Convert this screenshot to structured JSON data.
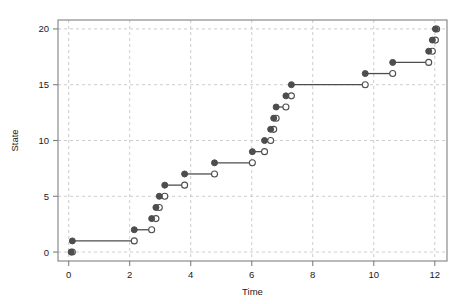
{
  "chart_data": {
    "type": "line",
    "variant": "step-post-with-open-closed-endpoints",
    "title": "",
    "xlabel": "Time",
    "ylabel": "State",
    "xlim": [
      -0.35,
      12.4
    ],
    "ylim": [
      -0.8,
      20.8
    ],
    "xticks": [
      0,
      2,
      4,
      6,
      8,
      10,
      12
    ],
    "xticklabels": [
      "0",
      "2",
      "4",
      "6",
      "8",
      "10",
      "12"
    ],
    "yticks": [
      0,
      5,
      10,
      15,
      20
    ],
    "yticklabels": [
      "0",
      "5",
      "10",
      "15",
      "20"
    ],
    "grid": true,
    "grid_style": "dashed",
    "grid_color": "#bfbfbf",
    "legend": "none",
    "line_color": "#4d4d4d",
    "marker_filled_color": "#4d4d4d",
    "marker_open_fill": "#ffffff",
    "marker_open_edge": "#4d4d4d",
    "axis_color": "#808080",
    "segments": [
      {
        "state": 0,
        "x_start": 0.08,
        "x_end": 0.12
      },
      {
        "state": 1,
        "x_start": 0.12,
        "x_end": 2.15
      },
      {
        "state": 2,
        "x_start": 2.15,
        "x_end": 2.72
      },
      {
        "state": 3,
        "x_start": 2.72,
        "x_end": 2.86
      },
      {
        "state": 4,
        "x_start": 2.86,
        "x_end": 2.97
      },
      {
        "state": 5,
        "x_start": 2.97,
        "x_end": 3.15
      },
      {
        "state": 6,
        "x_start": 3.15,
        "x_end": 3.8
      },
      {
        "state": 7,
        "x_start": 3.8,
        "x_end": 4.78
      },
      {
        "state": 8,
        "x_start": 4.78,
        "x_end": 6.02
      },
      {
        "state": 9,
        "x_start": 6.02,
        "x_end": 6.42
      },
      {
        "state": 10,
        "x_start": 6.42,
        "x_end": 6.62
      },
      {
        "state": 11,
        "x_start": 6.62,
        "x_end": 6.72
      },
      {
        "state": 12,
        "x_start": 6.72,
        "x_end": 6.8
      },
      {
        "state": 13,
        "x_start": 6.8,
        "x_end": 7.12
      },
      {
        "state": 14,
        "x_start": 7.12,
        "x_end": 7.3
      },
      {
        "state": 15,
        "x_start": 7.3,
        "x_end": 9.72
      },
      {
        "state": 16,
        "x_start": 9.72,
        "x_end": 10.62
      },
      {
        "state": 17,
        "x_start": 10.62,
        "x_end": 11.8
      },
      {
        "state": 18,
        "x_start": 11.8,
        "x_end": 11.92
      },
      {
        "state": 19,
        "x_start": 11.92,
        "x_end": 12.02
      },
      {
        "state": 20,
        "x_start": 12.02,
        "x_end": 12.06
      }
    ]
  }
}
